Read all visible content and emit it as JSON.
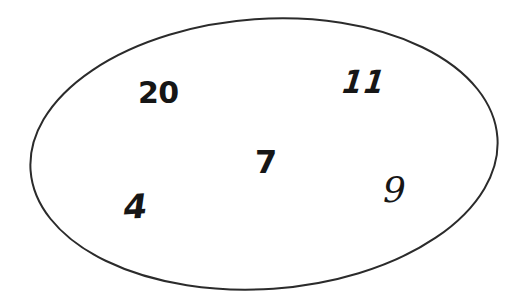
{
  "figure": {
    "kind": "set-oval-diagram",
    "background_color": "#ffffff",
    "caption": "",
    "width": 528,
    "height": 308
  },
  "oval": {
    "label": "set-boundary",
    "stroke_color": "#2b2b2b",
    "fill_color": "#ffffff",
    "stroke_width": 2,
    "center_x": 264,
    "center_y": 154,
    "radius_x": 234,
    "radius_y": 135,
    "rotation_deg": -4
  },
  "elements": [
    {
      "id": "element-20",
      "value": "20",
      "style": "bold-sans",
      "x": 138,
      "y": 78,
      "font_size": 30
    },
    {
      "id": "element-11",
      "value": "11",
      "style": "brush-italic",
      "x": 338,
      "y": 66,
      "font_size": 32
    },
    {
      "id": "element-7",
      "value": "7",
      "style": "bold-sans",
      "x": 255,
      "y": 146,
      "font_size": 32
    },
    {
      "id": "element-4",
      "value": "4",
      "style": "hand-italic",
      "x": 121,
      "y": 190,
      "font_size": 34
    },
    {
      "id": "element-9",
      "value": "9",
      "style": "serif-italic",
      "x": 383,
      "y": 172,
      "font_size": 36
    }
  ],
  "chart_data": {
    "type": "diagram",
    "diagram_type": "set-oval",
    "title": "",
    "xlabel": "",
    "ylabel": "",
    "members": [
      "20",
      "11",
      "7",
      "4",
      "9"
    ],
    "member_count": 5,
    "shapes": [
      {
        "name": "oval",
        "role": "set-container",
        "stroke": "#2b2b2b",
        "fill": "#ffffff"
      }
    ]
  }
}
